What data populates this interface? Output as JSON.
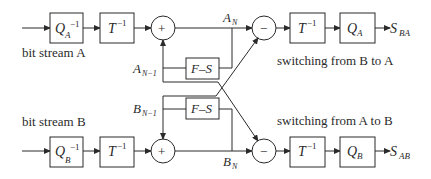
{
  "diagram": {
    "type": "block-diagram",
    "stream_a": {
      "label": "bit stream A",
      "dequant": {
        "base": "Q",
        "sub": "A",
        "sup": "−1"
      },
      "inv_transform": {
        "base": "T",
        "sup": "−1"
      },
      "adder": "+",
      "prev_label": {
        "base": "A",
        "sub": "N−1"
      },
      "out_label": {
        "base": "A",
        "sub": "N"
      },
      "fs_block": "F–S",
      "subtract": "−",
      "inv_transform_2": {
        "base": "T",
        "sup": "−1"
      },
      "quant": {
        "base": "Q",
        "sub": "A"
      },
      "output": {
        "base": "S",
        "sub": "BA"
      },
      "caption": "switching  from B to A"
    },
    "stream_b": {
      "label": "bit stream B",
      "dequant": {
        "base": "Q",
        "sub": "B",
        "sup": "−1"
      },
      "inv_transform": {
        "base": "T",
        "sup": "−1"
      },
      "adder": "+",
      "prev_label": {
        "base": "B",
        "sub": "N−1"
      },
      "out_label": {
        "base": "B",
        "sub": "N"
      },
      "fs_block": "F–S",
      "subtract": "−",
      "inv_transform_2": {
        "base": "T",
        "sup": "−1"
      },
      "quant": {
        "base": "Q",
        "sub": "B"
      },
      "output": {
        "base": "S",
        "sub": "AB"
      },
      "caption": "switching  from A to B"
    },
    "colors": {
      "stroke": "#2a2a2a",
      "background": "#ffffff"
    }
  }
}
